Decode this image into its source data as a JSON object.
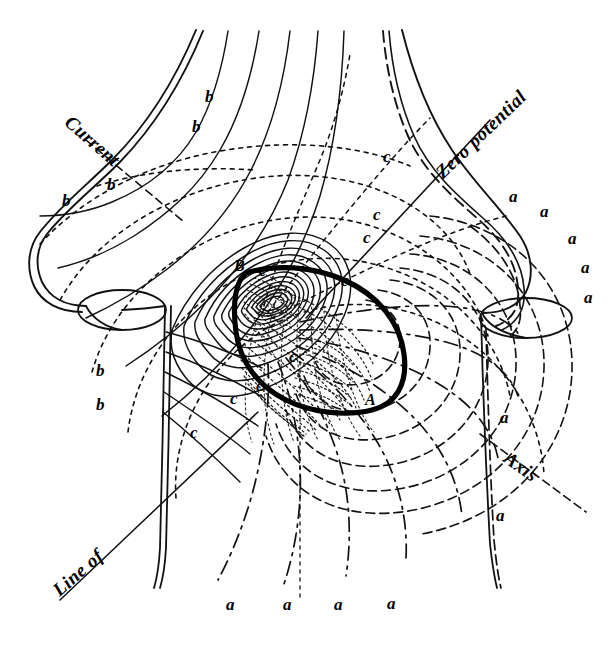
{
  "figure": {
    "background_color": "#ffffff",
    "ink_color": "#000000",
    "width": 612,
    "height": 645
  },
  "annotations": {
    "current": "Current",
    "line_of": "Line of",
    "zero_potential": "Zero potential",
    "axis": "Axis",
    "node_a": "A",
    "node_b": "B"
  },
  "curve_labels": {
    "a": "a",
    "b": "b",
    "c": "c"
  },
  "label_positions": {
    "b_labels": [
      {
        "id": "b1",
        "x": 205,
        "y": 88,
        "text": "b"
      },
      {
        "id": "b2",
        "x": 192,
        "y": 118,
        "text": "b"
      },
      {
        "id": "b3",
        "x": 107,
        "y": 176,
        "text": "b"
      },
      {
        "id": "b4",
        "x": 62,
        "y": 192,
        "text": "b"
      },
      {
        "id": "b5",
        "x": 96,
        "y": 362,
        "text": "b"
      },
      {
        "id": "b6",
        "x": 96,
        "y": 396,
        "text": "b"
      }
    ],
    "c_labels": [
      {
        "id": "c1",
        "x": 383,
        "y": 148,
        "text": "c"
      },
      {
        "id": "c2",
        "x": 373,
        "y": 206,
        "text": "c"
      },
      {
        "id": "c3",
        "x": 363,
        "y": 229,
        "text": "c"
      },
      {
        "id": "c4",
        "x": 341,
        "y": 272,
        "text": "c"
      },
      {
        "id": "c5",
        "x": 289,
        "y": 348,
        "text": "c"
      },
      {
        "id": "c6",
        "x": 256,
        "y": 377,
        "text": "c"
      },
      {
        "id": "c7",
        "x": 230,
        "y": 390,
        "text": "c"
      },
      {
        "id": "c8",
        "x": 190,
        "y": 424,
        "text": "c"
      },
      {
        "id": "c9",
        "x": 259,
        "y": 268,
        "text": "c"
      }
    ],
    "a_labels_right": [
      {
        "id": "ar1",
        "x": 509,
        "y": 188,
        "text": "a"
      },
      {
        "id": "ar2",
        "x": 540,
        "y": 203,
        "text": "a"
      },
      {
        "id": "ar3",
        "x": 568,
        "y": 230,
        "text": "a"
      },
      {
        "id": "ar4",
        "x": 581,
        "y": 259,
        "text": "a"
      },
      {
        "id": "ar5",
        "x": 584,
        "y": 289,
        "text": "a"
      },
      {
        "id": "ar6",
        "x": 500,
        "y": 409,
        "text": "a"
      },
      {
        "id": "ar7",
        "x": 496,
        "y": 507,
        "text": "a"
      }
    ],
    "a_labels_bottom": [
      {
        "id": "ab1",
        "x": 226,
        "y": 600,
        "text": "a"
      },
      {
        "id": "ab2",
        "x": 283,
        "y": 600,
        "text": "a"
      },
      {
        "id": "ab3",
        "x": 334,
        "y": 600,
        "text": "a"
      },
      {
        "id": "ab4",
        "x": 387,
        "y": 599,
        "text": "a"
      }
    ]
  },
  "legend_notes": {
    "a_meaning": "a",
    "b_meaning": "b",
    "c_meaning": "c"
  }
}
